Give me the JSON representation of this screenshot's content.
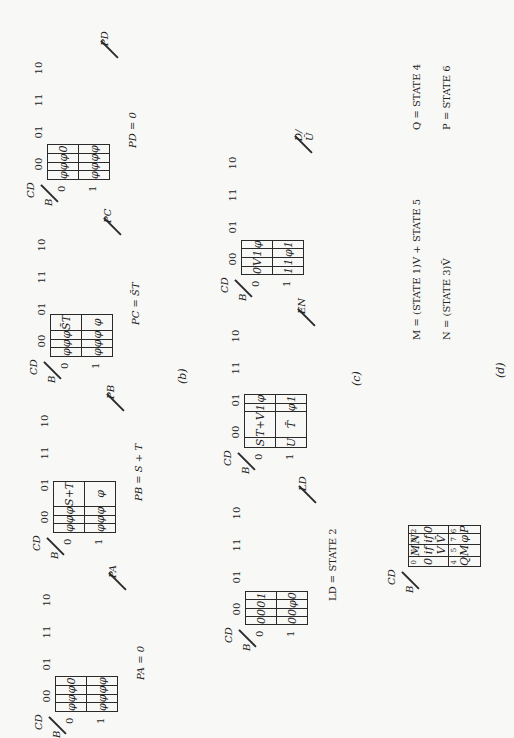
{
  "figure": {
    "part_b": {
      "caption": "(b)",
      "maps": [
        {
          "output": "P_A",
          "output_label": "PA",
          "col_var": "CD",
          "row_var": "B",
          "columns": [
            "00",
            "01",
            "11",
            "10"
          ],
          "rows": [
            "0",
            "1"
          ],
          "cells": [
            [
              "φ",
              "φ",
              "φ",
              "0"
            ],
            [
              "φ",
              "φ",
              "φ",
              "φ"
            ]
          ],
          "equation": "PA = 0"
        },
        {
          "output": "P_B",
          "output_label": "PB",
          "col_var": "CD",
          "row_var": "B",
          "columns": [
            "00",
            "01",
            "11",
            "10"
          ],
          "rows": [
            "0",
            "1"
          ],
          "cells": [
            [
              "φ",
              "φ",
              "φ",
              "S+T"
            ],
            [
              "φ",
              "φ",
              "φ",
              "φ"
            ]
          ],
          "equation": "PB = S + T"
        },
        {
          "output": "P_C",
          "output_label": "PC",
          "col_var": "CD",
          "row_var": "B",
          "columns": [
            "00",
            "01",
            "11",
            "10"
          ],
          "rows": [
            "0",
            "1"
          ],
          "cells": [
            [
              "φ",
              "φ",
              "φ",
              "S̄T"
            ],
            [
              "φ",
              "φ",
              "φ",
              "φ"
            ]
          ],
          "equation": "PC = S̄T"
        },
        {
          "output": "P_D",
          "output_label": "PD",
          "col_var": "CD",
          "row_var": "B",
          "columns": [
            "00",
            "01",
            "11",
            "10"
          ],
          "rows": [
            "0",
            "1"
          ],
          "cells": [
            [
              "φ",
              "φ",
              "φ",
              "0"
            ],
            [
              "φ",
              "φ",
              "φ",
              "φ"
            ]
          ],
          "equation": "PD = 0"
        }
      ]
    },
    "part_c": {
      "caption": "(c)",
      "maps": [
        {
          "output": "LD",
          "output_label": "LD",
          "col_var": "CD",
          "row_var": "B",
          "columns": [
            "00",
            "01",
            "11",
            "10"
          ],
          "rows": [
            "0",
            "1"
          ],
          "cells": [
            [
              "0",
              "0",
              "0",
              "1"
            ],
            [
              "0",
              "0",
              "φ",
              "0"
            ]
          ],
          "equation": "LD = STATE 2"
        },
        {
          "output": "EN",
          "output_label": "EN",
          "col_var": "CD",
          "row_var": "B",
          "columns": [
            "00",
            "01",
            "11",
            "10"
          ],
          "rows": [
            "0",
            "1"
          ],
          "cells": [
            [
              "S",
              "T+V",
              "1",
              "φ"
            ],
            [
              "U",
              "T̄",
              "φ",
              "1"
            ]
          ],
          "equation": ""
        },
        {
          "output": "D/U",
          "output_label": "D/Ū",
          "col_var": "CD",
          "row_var": "B",
          "columns": [
            "00",
            "01",
            "11",
            "10"
          ],
          "rows": [
            "0",
            "1"
          ],
          "cells": [
            [
              "0",
              "V",
              "1",
              "φ"
            ],
            [
              "1",
              "1",
              "φ",
              "1"
            ]
          ],
          "equation": ""
        }
      ]
    },
    "part_d": {
      "caption": "(d)",
      "col_var": "CD",
      "row_var": "B",
      "cells": [
        [
          {
            "text": "0",
            "index": "0"
          },
          {
            "text": "M if V",
            "index": "1"
          },
          {
            "text": "N if V̄",
            "index": "3"
          },
          {
            "text": "0",
            "index": "2"
          }
        ],
        [
          {
            "text": "Q",
            "index": "4"
          },
          {
            "text": "M",
            "index": "5"
          },
          {
            "text": "φ",
            "index": "7"
          },
          {
            "text": "P",
            "index": "6"
          }
        ]
      ],
      "equations": {
        "m": "M = (STATE 1)V + STATE 5",
        "n": "N = (STATE 3)V̄",
        "q": "Q = STATE 4",
        "p": "P = STATE 6"
      }
    }
  }
}
